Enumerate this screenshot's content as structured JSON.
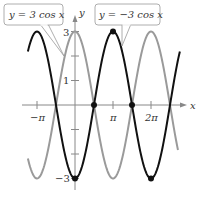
{
  "chart_data": {
    "type": "line",
    "title": "",
    "xlabel": "x",
    "ylabel": "y",
    "xlim_pi": [
      -1.24,
      2.75
    ],
    "ylim": [
      -3,
      3
    ],
    "grid": false,
    "x_ticks": [
      {
        "value_pi": -1,
        "label": "−π"
      },
      {
        "value_pi": 1,
        "label": "π"
      },
      {
        "value_pi": 2,
        "label": "2π"
      }
    ],
    "y_ticks": [
      {
        "value": 3,
        "label": "3"
      },
      {
        "value": 2,
        "label": ""
      },
      {
        "value": 1,
        "label": "1"
      },
      {
        "value": -1,
        "label": ""
      },
      {
        "value": -2,
        "label": ""
      },
      {
        "value": -3,
        "label": "−3"
      }
    ],
    "series": [
      {
        "name": "y = 3 cos x",
        "function": "3*cos(x)",
        "color": "#9a9a9a",
        "x_range_pi": [
          -1.24,
          2.71
        ]
      },
      {
        "name": "y = −3 cos x",
        "function": "-3*cos(x)",
        "color": "#111111",
        "x_range_pi": [
          -1.24,
          2.76
        ]
      }
    ],
    "marked_points": [
      {
        "x_label": "0",
        "y": -3
      },
      {
        "x_label": "π/2",
        "y": 0
      },
      {
        "x_label": "π",
        "y": 3
      },
      {
        "x_label": "3π/2",
        "y": 0
      },
      {
        "x_label": "2π",
        "y": -3
      }
    ],
    "annotations": [
      {
        "text": "y = 3 cos x",
        "points_to": "gray curve"
      },
      {
        "text": "y = −3 cos x",
        "points_to": "black curve"
      }
    ]
  },
  "labels": {
    "x_axis": "x",
    "y_axis": "y",
    "callout_left": "y = 3 cos x",
    "callout_right": "y = −3 cos x",
    "tick_neg_pi": "−π",
    "tick_pi": "π",
    "tick_2pi": "2π",
    "tick_3": "3",
    "tick_1": "1",
    "tick_neg3": "−3"
  }
}
